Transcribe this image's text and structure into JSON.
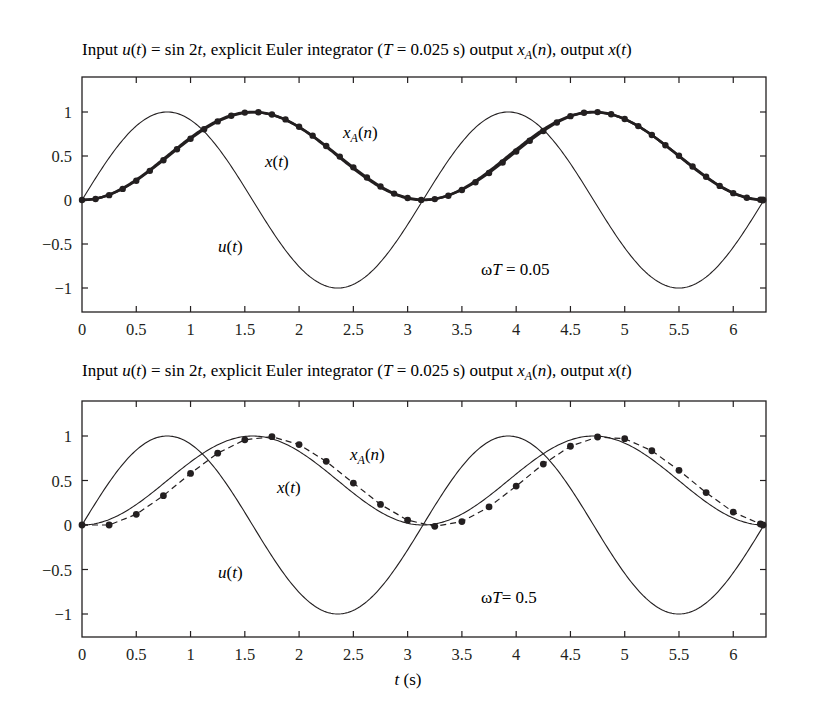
{
  "chart_data": [
    {
      "type": "line",
      "title": "Input u(t) = sin 2t, explicit Euler integrator (T = 0.025 s) output x_A(n), output x(t)",
      "title_parts": {
        "p1": "Input ",
        "u": "u",
        "t1": "(",
        "t1i": "t",
        "t1c": ") = sin 2",
        "t2i": "t",
        "p2": ", explicit Euler integrator (",
        "Ti": "T",
        "p3": " = 0.025 s) output ",
        "xi": "x",
        "sub": "A",
        "p4": "(",
        "ni": "n",
        "p5": "), output ",
        "x2i": "x",
        "p6": "(",
        "t3i": "t",
        "p7": ")"
      },
      "xlabel": "",
      "ylabel": "",
      "xlim": [
        0,
        6.2832
      ],
      "ylim": [
        -1.27,
        1.35
      ],
      "xticks": [
        0,
        0.5,
        1,
        1.5,
        2,
        2.5,
        3,
        3.5,
        4,
        4.5,
        5,
        5.5,
        6
      ],
      "xtick_labels": [
        "0",
        "0.5",
        "1",
        "1.5",
        "2",
        "2.5",
        "3",
        "3.5",
        "4",
        "4.5",
        "5",
        "5.5",
        "6"
      ],
      "yticks": [
        1,
        0.5,
        0,
        -0.5,
        -1
      ],
      "ytick_labels": [
        "1",
        "0.5",
        "0",
        "−0.5",
        "−1"
      ],
      "grid": false,
      "legend": "none (inline annotations)",
      "annotations": [
        {
          "text": "x_A(n)",
          "x": 2.43,
          "y": 0.78
        },
        {
          "text": "x(t)",
          "x": 1.69,
          "y": 0.44
        },
        {
          "text": "u(t)",
          "x": 1.25,
          "y": -0.52
        },
        {
          "text": "ωT = 0.05",
          "x": 3.67,
          "y": -0.78
        }
      ],
      "series": [
        {
          "name": "u(t)",
          "formula": "sin(2t)",
          "style": "thin solid"
        },
        {
          "name": "x(t)",
          "formula": "(1 - cos(2t))/2",
          "style": "solid"
        },
        {
          "name": "x_A(n)",
          "style": "thick solid with dot markers (every 5th sample, 0.125 s)",
          "x": [
            0,
            0.125,
            0.25,
            0.375,
            0.5,
            0.625,
            0.75,
            0.875,
            1,
            1.125,
            1.25,
            1.375,
            1.5,
            1.625,
            1.75,
            1.875,
            2,
            2.125,
            2.25,
            2.375,
            2.5,
            2.625,
            2.75,
            2.875,
            3,
            3.125,
            3.25,
            3.375,
            3.5,
            3.625,
            3.75,
            3.875,
            4,
            4.125,
            4.25,
            4.375,
            4.5,
            4.625,
            4.75,
            4.875,
            5,
            5.125,
            5.25,
            5.375,
            5.5,
            5.625,
            5.75,
            5.875,
            6,
            6.125,
            6.25
          ],
          "values": [
            0.0,
            0.012,
            0.055,
            0.126,
            0.219,
            0.331,
            0.452,
            0.577,
            0.696,
            0.804,
            0.893,
            0.957,
            0.993,
            0.998,
            0.972,
            0.916,
            0.833,
            0.731,
            0.614,
            0.493,
            0.371,
            0.256,
            0.153,
            0.073,
            0.023,
            0.001,
            0.01,
            0.049,
            0.114,
            0.201,
            0.307,
            0.426,
            0.551,
            0.673,
            0.784,
            0.881,
            0.953,
            0.992,
            0.999,
            0.975,
            0.921,
            0.84,
            0.738,
            0.622,
            0.502,
            0.38,
            0.264,
            0.16,
            0.078,
            0.026,
            0.002
          ]
        }
      ]
    },
    {
      "type": "line",
      "title": "Input u(t) = sin 2t, explicit Euler integrator (T = 0.025 s) output x_A(n), output x(t)",
      "xlabel": "t (s)",
      "xlabel_parts": {
        "var": "t",
        "unit": " (s)"
      },
      "ylabel": "",
      "xlim": [
        0,
        6.2832
      ],
      "ylim": [
        -1.25,
        1.4
      ],
      "xticks": [
        0,
        0.5,
        1,
        1.5,
        2,
        2.5,
        3,
        3.5,
        4,
        4.5,
        5,
        5.5,
        6
      ],
      "xtick_labels": [
        "0",
        "0.5",
        "1",
        "1.5",
        "2",
        "2.5",
        "3",
        "3.5",
        "4",
        "4.5",
        "5",
        "5.5",
        "6"
      ],
      "yticks": [
        1,
        0.5,
        0,
        -0.5,
        -1
      ],
      "ytick_labels": [
        "1",
        "0.5",
        "0",
        "−0.5",
        "−1"
      ],
      "grid": false,
      "legend": "none (inline annotations)",
      "annotations": [
        {
          "text": "x_A(n)",
          "x": 2.47,
          "y": 0.78
        },
        {
          "text": "x(t)",
          "x": 1.81,
          "y": 0.42
        },
        {
          "text": "u(t)",
          "x": 1.25,
          "y": -0.52
        },
        {
          "text": "ωT= 0.5",
          "x": 3.67,
          "y": -0.78
        }
      ],
      "series": [
        {
          "name": "u(t)",
          "formula": "sin(2t)",
          "style": "solid"
        },
        {
          "name": "x(t)",
          "formula": "(1 - cos(2t))/2",
          "style": "solid"
        },
        {
          "name": "x_A(n)",
          "style": "dashed with dot markers (T = 0.25 s)",
          "x": [
            0,
            0.25,
            0.5,
            0.75,
            1,
            1.25,
            1.5,
            1.75,
            2,
            2.25,
            2.5,
            2.75,
            3,
            3.25,
            3.5,
            3.75,
            4,
            4.25,
            4.5,
            4.75,
            5,
            5.25,
            5.5,
            5.75,
            6,
            6.25
          ],
          "values": [
            0,
            0,
            0.12,
            0.33,
            0.58,
            0.807,
            0.957,
            0.992,
            0.904,
            0.715,
            0.471,
            0.231,
            0.054,
            -0.015,
            0.038,
            0.203,
            0.437,
            0.685,
            0.885,
            0.989,
            0.97,
            0.834,
            0.614,
            0.364,
            0.145,
            0.011
          ]
        }
      ]
    }
  ],
  "panels": [
    {
      "title": {
        "a": "Input ",
        "b": "u",
        "c": "(",
        "d": "t",
        "e": ") = sin 2",
        "f": "t",
        "g": ", explicit Euler integrator (",
        "h": "T",
        "i": " = 0.025 s) output ",
        "j": "x",
        "k": "A",
        "l": "(",
        "m": "n",
        "n": "), output ",
        "o": "x",
        "p": "(",
        "q": "t",
        "r": ")"
      },
      "ann_xA": {
        "x": "x",
        "sub": "A",
        "open": "(",
        "n": "n",
        "close": ")"
      },
      "ann_x": {
        "x": "x",
        "open": "(",
        "t": "t",
        "close": ")"
      },
      "ann_u": {
        "u": "u",
        "open": "(",
        "t": "t",
        "close": ")"
      },
      "ann_wT": {
        "w": "ω",
        "T": "T",
        "rest": " = 0.05"
      }
    },
    {
      "title": {
        "a": "Input ",
        "b": "u",
        "c": "(",
        "d": "t",
        "e": ") = sin 2",
        "f": "t",
        "g": ", explicit Euler integrator (",
        "h": "T",
        "i": " = 0.025 s) output ",
        "j": "x",
        "k": "A",
        "l": "(",
        "m": "n",
        "n": "), output ",
        "o": "x",
        "p": "(",
        "q": "t",
        "r": ")"
      },
      "ann_xA": {
        "x": "x",
        "sub": "A",
        "open": "(",
        "n": "n",
        "close": ")"
      },
      "ann_x": {
        "x": "x",
        "open": "(",
        "t": "t",
        "close": ")"
      },
      "ann_u": {
        "u": "u",
        "open": "(",
        "t": "t",
        "close": ")"
      },
      "ann_wT": {
        "w": "ω",
        "T": "T",
        "rest": "= 0.5"
      },
      "xlabel": {
        "var": "t",
        "unit": " (s)"
      }
    }
  ],
  "colors": {
    "ink": "#231f20",
    "background": "#ffffff"
  }
}
